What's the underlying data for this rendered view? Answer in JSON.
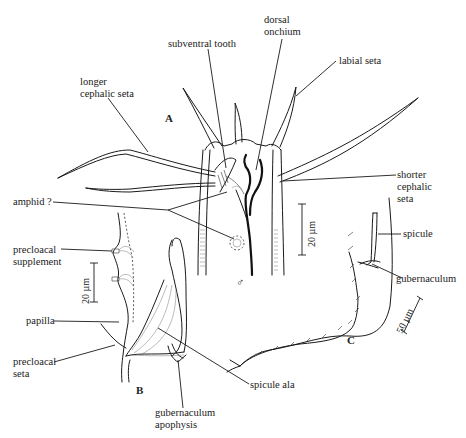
{
  "figure": {
    "panels": [
      {
        "id": "A",
        "label": "A",
        "description": "anterior end, male, head region"
      },
      {
        "id": "B",
        "label": "B",
        "description": "male tail region, copulatory apparatus"
      },
      {
        "id": "C",
        "label": "C",
        "description": "male posterior end"
      }
    ],
    "labels": {
      "subventral_tooth": "subventral tooth",
      "dorsal_onchium": "dorsal\nonchium",
      "labial_seta": "labial seta",
      "longer_cephalic_seta": "longer\ncephalic seta",
      "shorter_cephalic_seta": "shorter\ncephalic\nseta",
      "amphid": "amphid ?",
      "precloacal_supplement": "precloacal\nsupplement",
      "papilla": "papilla",
      "precloacal_seta": "precloacal\nseta",
      "spicule_ala": "spicule ala",
      "gubernaculum_apophysis": "gubernaculum\napophysis",
      "spicule": "spicule",
      "gubernaculum": "gubernaculum"
    },
    "sex_symbol": "♂",
    "scale_bars": {
      "panel_A": "20 µm",
      "panel_B": "20 µm",
      "panel_C": "50 µm"
    },
    "colors": {
      "ink": "#1a1a1a",
      "background": "#ffffff"
    }
  }
}
